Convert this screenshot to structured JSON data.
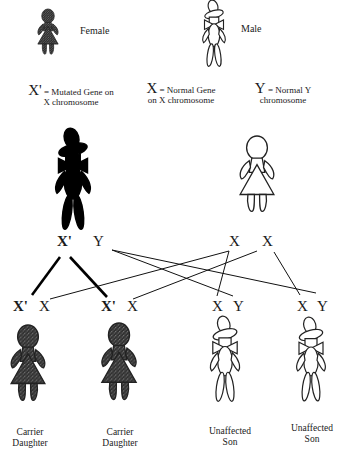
{
  "legend": {
    "female_label": "Female",
    "male_label": "Male"
  },
  "key": {
    "mutated": {
      "symbol": "X'",
      "text_line1": "= Mutated Gene on",
      "text_line2": "X chromosome"
    },
    "normal_x": {
      "symbol": "X",
      "text_line1": "= Normal Gene",
      "text_line2": "on X chromosome"
    },
    "normal_y": {
      "symbol": "Y",
      "text_line1": "= Normal Y",
      "text_line2": "chromosome"
    }
  },
  "parents": {
    "father": {
      "figure": "male",
      "affected": true,
      "alleles": [
        "X'",
        "Y"
      ]
    },
    "mother": {
      "figure": "female",
      "affected": false,
      "alleles": [
        "X",
        "X"
      ]
    }
  },
  "offspring": [
    {
      "figure": "female",
      "alleles": [
        "X'",
        "X"
      ],
      "caption_line1": "Carrier",
      "caption_line2": "Daughter"
    },
    {
      "figure": "female",
      "alleles": [
        "X'",
        "X"
      ],
      "caption_line1": "Carrier",
      "caption_line2": "Daughter"
    },
    {
      "figure": "male",
      "alleles": [
        "X",
        "Y"
      ],
      "caption_line1": "Unaffected",
      "caption_line2": "Son"
    },
    {
      "figure": "male",
      "alleles": [
        "X",
        "Y"
      ],
      "caption_line1": "Unaffected",
      "caption_line2": "Son"
    }
  ],
  "colors": {
    "affected_fill": "#000000",
    "carrier_fill": "#3a3a3a",
    "outline": "#1a1a1a",
    "background": "#ffffff"
  }
}
